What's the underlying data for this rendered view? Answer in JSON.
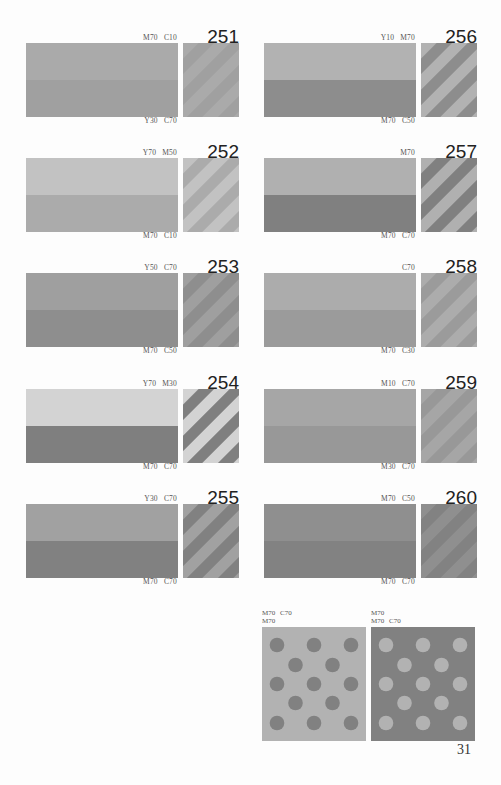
{
  "entries": [
    {
      "number": "251",
      "top_label": "M70  C10",
      "bottom_label": "Y30  C70",
      "top_color": "#aaaaaa",
      "bottom_color": "#a0a0a0"
    },
    {
      "number": "252",
      "top_label": "Y70  M50",
      "bottom_label": "M70  C10",
      "top_color": "#c2c2c2",
      "bottom_color": "#ababab"
    },
    {
      "number": "253",
      "top_label": "Y50  C70",
      "bottom_label": "M70  C50",
      "top_color": "#9f9f9f",
      "bottom_color": "#8e8e8e"
    },
    {
      "number": "254",
      "top_label": "Y70  M30",
      "bottom_label": "M70  C70",
      "top_color": "#d3d3d3",
      "bottom_color": "#7f7f7f"
    },
    {
      "number": "255",
      "top_label": "Y30  C70",
      "bottom_label": "M70  C70",
      "top_color": "#a1a1a1",
      "bottom_color": "#818181"
    },
    {
      "number": "256",
      "top_label": "Y10  M70",
      "bottom_label": "M70  C50",
      "top_color": "#b2b2b2",
      "bottom_color": "#8d8d8d"
    },
    {
      "number": "257",
      "top_label": "M70",
      "bottom_label": "M70  C70",
      "top_color": "#b0b0b0",
      "bottom_color": "#808080"
    },
    {
      "number": "258",
      "top_label": "C70",
      "bottom_label": "M70  C30",
      "top_color": "#acacac",
      "bottom_color": "#9b9b9b"
    },
    {
      "number": "259",
      "top_label": "M10  C70",
      "bottom_label": "M30  C70",
      "top_color": "#a6a6a6",
      "bottom_color": "#989898"
    },
    {
      "number": "260",
      "top_label": "M70  C50",
      "bottom_label": "M70  C70",
      "top_color": "#8f8f8f",
      "bottom_color": "#828282"
    }
  ],
  "dot_patterns": [
    {
      "label_line1": "M70  C70",
      "label_line2": "M70",
      "background_color": "#b2b2b2",
      "dot_color": "#818181"
    },
    {
      "label_line1": "M70",
      "label_line2": "M70  C70",
      "background_color": "#818181",
      "dot_color": "#b2b2b2"
    }
  ],
  "page_number": "31"
}
